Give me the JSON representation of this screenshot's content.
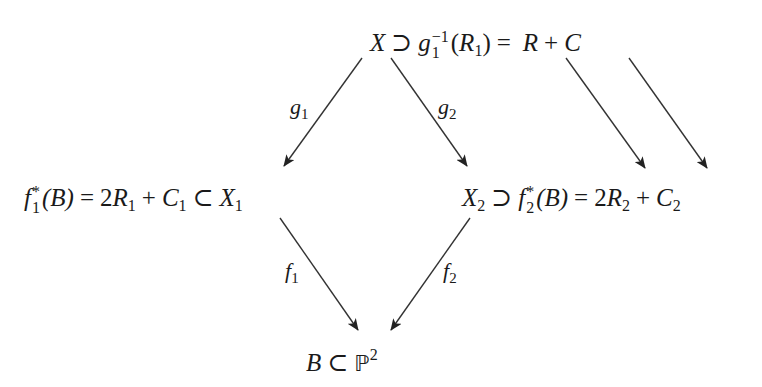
{
  "diagram": {
    "type": "commutative-diagram",
    "nodes": {
      "top": {
        "text": "X ⊃ g_1^{-1}(R_1) = R + C",
        "parts": {
          "X": "X",
          "supset": "⊃",
          "g": "g",
          "g_sub": "1",
          "g_sup": "−1",
          "paren_open": "(",
          "R": "R",
          "R_sub": "1",
          "paren_close": ")",
          "eq": "=",
          "R2": "R",
          "plus": "+",
          "C": "C"
        }
      },
      "left": {
        "text": "f_1^*(B) = 2R_1 + C_1 ⊂ X_1",
        "parts": {
          "f": "f",
          "f_sub": "1",
          "f_sup": "*",
          "B": "(B)",
          "eq": "=",
          "coef": "2",
          "R": "R",
          "R_sub": "1",
          "plus": "+",
          "C": "C",
          "C_sub": "1",
          "subset": "⊂",
          "X": "X",
          "X_sub": "1"
        }
      },
      "right": {
        "text": "X_2 ⊃ f_2^*(B) = 2R_2 + C_2",
        "parts": {
          "X": "X",
          "X_sub": "2",
          "supset": "⊃",
          "f": "f",
          "f_sub": "2",
          "f_sup": "*",
          "B": "(B)",
          "eq": "=",
          "coef": "2",
          "R": "R",
          "R_sub": "2",
          "plus": "+",
          "C": "C",
          "C_sub": "2"
        }
      },
      "bottom": {
        "text": "B ⊂ ℙ^2",
        "parts": {
          "B": "B",
          "subset": "⊂",
          "P": "ℙ",
          "P_sup": "2"
        }
      }
    },
    "arrows": [
      {
        "from": "top.X",
        "to": "left.X_1",
        "label": "g",
        "label_sub": "1"
      },
      {
        "from": "top.X",
        "to": "right.X_2",
        "label": "g",
        "label_sub": "2"
      },
      {
        "from": "left.X_1",
        "to": "bottom.B",
        "label": "f",
        "label_sub": "1"
      },
      {
        "from": "right.X_2",
        "to": "bottom.B",
        "label": "f",
        "label_sub": "2"
      },
      {
        "from": "top.R",
        "to": "right.R_2",
        "label": ""
      },
      {
        "from": "top.C",
        "to": "right.C_2",
        "label": ""
      }
    ],
    "colors": {
      "ink": "#1a1a1a",
      "arrow": "#333333",
      "background": "#ffffff"
    }
  }
}
